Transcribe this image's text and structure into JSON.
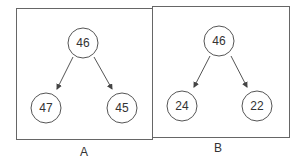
{
  "colors": {
    "stroke": "#555555",
    "text": "#333333",
    "background": "#ffffff"
  },
  "panels": [
    {
      "label": "A",
      "root": {
        "value": "46"
      },
      "left_child": {
        "value": "47"
      },
      "right_child": {
        "value": "45"
      }
    },
    {
      "label": "B",
      "root": {
        "value": "46"
      },
      "left_child": {
        "value": "24"
      },
      "right_child": {
        "value": "22"
      }
    }
  ]
}
